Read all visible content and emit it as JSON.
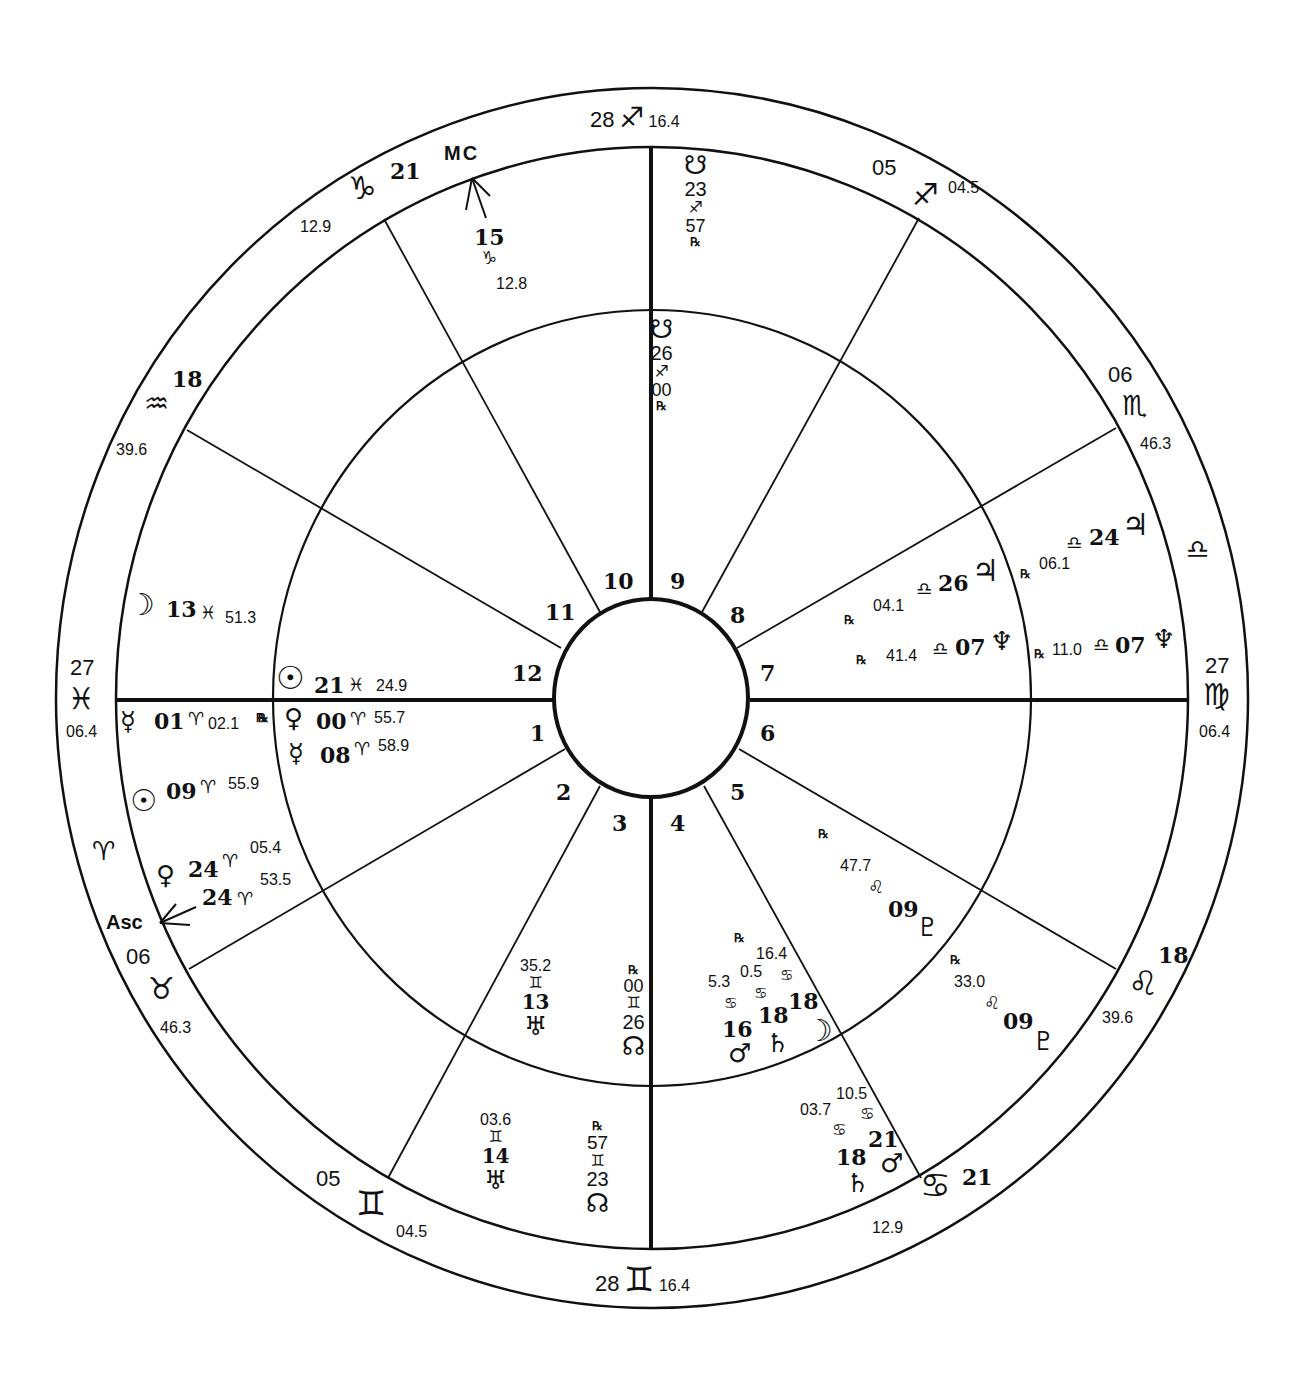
{
  "chart_title": "",
  "wheel": {
    "center": [
      652,
      698
    ],
    "outer_radius": [
      596,
      610
    ],
    "ring_radius": [
      536,
      551
    ],
    "middle_radius": [
      379,
      388
    ],
    "hub_radius": [
      97,
      99
    ],
    "line_color": "#111111",
    "background": "#ffffff"
  },
  "houses": {
    "numbers": [
      "1",
      "2",
      "3",
      "4",
      "5",
      "6",
      "7",
      "8",
      "9",
      "10",
      "11",
      "12"
    ]
  },
  "cusps": [
    {
      "id": "mc-cusp-sagittarius",
      "deg": "28",
      "sign": "♐",
      "min": "16.4"
    },
    {
      "id": "cusp-11-sagittarius",
      "deg": "05",
      "sign": "♐",
      "min": "04.5"
    },
    {
      "id": "cusp-12-scorpio",
      "deg": "06",
      "sign": "♏",
      "min": "46.3"
    },
    {
      "id": "intercepted-libra",
      "deg": "",
      "sign": "♎",
      "min": ""
    },
    {
      "id": "desc-cusp-virgo",
      "deg": "27",
      "sign": "♍",
      "min": "06.4"
    },
    {
      "id": "cusp-leo",
      "deg": "18",
      "sign": "♌",
      "min": "39.6"
    },
    {
      "id": "cusp-cancer",
      "deg": "21",
      "sign": "♋",
      "min": "12.9"
    },
    {
      "id": "ic-cusp-gemini",
      "deg": "28",
      "sign": "♊",
      "min": "16.4"
    },
    {
      "id": "cusp-gemini-2",
      "deg": "05",
      "sign": "♊",
      "min": "04.5"
    },
    {
      "id": "cusp-taurus",
      "deg": "06",
      "sign": "♉",
      "min": "46.3"
    },
    {
      "id": "intercepted-aries",
      "deg": "",
      "sign": "♈",
      "min": ""
    },
    {
      "id": "asc-cusp-pisces",
      "deg": "27",
      "sign": "♓",
      "min": "06.4"
    },
    {
      "id": "cusp-aquarius",
      "deg": "18",
      "sign": "♒",
      "min": "39.6"
    },
    {
      "id": "cusp-capricorn",
      "deg": "21",
      "sign": "♑",
      "min": "12.9"
    }
  ],
  "points": {
    "mc": {
      "label": "MC",
      "deg": "15",
      "sign": "♑",
      "min": "12.8"
    },
    "asc": {
      "label": "Asc",
      "deg": "24",
      "sign": "♈",
      "min": "53.5"
    }
  },
  "outer_planets": {
    "south_node_top": {
      "glyph": "☋",
      "deg": "23",
      "sign": "♐",
      "min": "57",
      "rx": "℞"
    },
    "jupiter": {
      "glyph": "♃",
      "deg": "24",
      "sign": "♎",
      "min": "06.1",
      "rx": "℞"
    },
    "neptune": {
      "glyph": "♆",
      "deg": "07",
      "sign": "♎",
      "min": "11.0",
      "rx": "℞"
    },
    "pluto": {
      "glyph": "♇",
      "deg": "09",
      "sign": "♌",
      "min": "33.0",
      "rx": "℞"
    },
    "mars": {
      "glyph": "♂",
      "deg": "21",
      "sign": "♋",
      "min": "10.5"
    },
    "saturn": {
      "glyph": "♄",
      "deg": "18",
      "sign": "♋",
      "min": "03.7"
    },
    "north_node": {
      "glyph": "☊",
      "deg": "23",
      "sign": "♊",
      "min": "57",
      "rx": "℞"
    },
    "uranus": {
      "glyph": "♅",
      "deg": "14",
      "sign": "♊",
      "min": "03.6"
    },
    "venus": {
      "glyph": "♀",
      "deg": "24",
      "sign": "♈",
      "min": "05.4"
    },
    "sun": {
      "glyph": "☉",
      "deg": "09",
      "sign": "♈",
      "min": "55.9"
    },
    "mercury": {
      "glyph": "☿",
      "deg": "01",
      "sign": "♈",
      "min": "02.1",
      "rx": "℞"
    },
    "moon": {
      "glyph": "☽",
      "deg": "13",
      "sign": "♓",
      "min": "51.3"
    }
  },
  "inner_planets": {
    "south_node": {
      "glyph": "☋",
      "deg": "26",
      "sign": "♐",
      "min": "00",
      "rx": "℞"
    },
    "jupiter": {
      "glyph": "♃",
      "deg": "26",
      "sign": "♎",
      "min": "04.1",
      "rx": "℞"
    },
    "neptune": {
      "glyph": "♆",
      "deg": "07",
      "sign": "♎",
      "min": "41.4",
      "rx": "℞"
    },
    "pluto": {
      "glyph": "♇",
      "deg": "09",
      "sign": "♌",
      "min": "47.7",
      "rx": "℞"
    },
    "moon": {
      "glyph": "☽",
      "deg": "18",
      "sign": "♋",
      "min": "16.4"
    },
    "saturn": {
      "glyph": "♄",
      "deg": "18",
      "sign": "♋",
      "min": "0.5",
      "rx": "℞"
    },
    "mars": {
      "glyph": "♂",
      "deg": "16",
      "sign": "♋",
      "min": "5.3"
    },
    "north_node": {
      "glyph": "☊",
      "deg": "26",
      "sign": "♊",
      "min": "00",
      "rx": "℞"
    },
    "uranus": {
      "glyph": "♅",
      "deg": "13",
      "sign": "♊",
      "min": "35.2"
    },
    "mercury": {
      "glyph": "☿",
      "deg": "08",
      "sign": "♈",
      "min": "58.9"
    },
    "venus": {
      "glyph": "♀",
      "deg": "00",
      "sign": "♈",
      "min": "55.7",
      "rx": "℞"
    },
    "sun": {
      "glyph": "☉",
      "deg": "21",
      "sign": "♓",
      "min": "24.9"
    }
  }
}
